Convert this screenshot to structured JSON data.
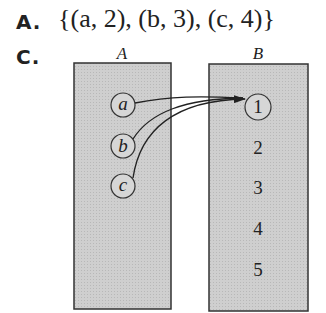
{
  "options": {
    "a": {
      "label": "A.",
      "text": "{(a, 2), (b, 3), (c, 4)}"
    },
    "c": {
      "label": "C."
    }
  },
  "diagram": {
    "type": "mapping-diagram",
    "colors": {
      "box_fill": "#c8c8c8",
      "box_stroke": "#333333",
      "circle_fill": "#d4d4d4",
      "arrow": "#222222"
    },
    "domain": {
      "title": "A",
      "elements": [
        "a",
        "b",
        "c"
      ]
    },
    "codomain": {
      "title": "B",
      "elements": [
        "1",
        "2",
        "3",
        "4",
        "5"
      ]
    },
    "mappings": [
      {
        "from": "a",
        "to": "1"
      },
      {
        "from": "b",
        "to": "1"
      },
      {
        "from": "c",
        "to": "1"
      }
    ]
  }
}
